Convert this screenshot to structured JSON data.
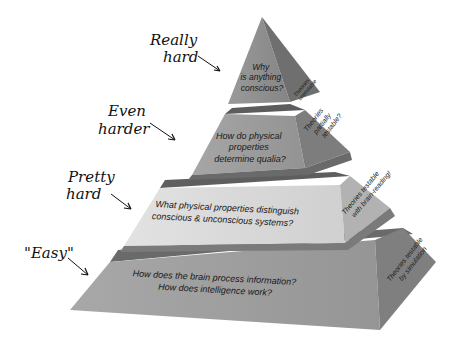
{
  "diagram": {
    "type": "pyramid",
    "tiers": [
      {
        "level": 1,
        "label": "Really hard",
        "label_lines": [
          "Really",
          "hard"
        ],
        "question_lines": [
          "Why",
          "is anything",
          "conscious?"
        ],
        "side_lines": [
          "Theories",
          "untestable"
        ]
      },
      {
        "level": 2,
        "label": "Even harder",
        "label_lines": [
          "Even",
          "harder"
        ],
        "question_lines": [
          "How do physical",
          "properties",
          "determine qualia?"
        ],
        "side_lines": [
          "Theories",
          "partially",
          "testable?"
        ]
      },
      {
        "level": 3,
        "label": "Pretty hard",
        "label_lines": [
          "Pretty",
          "hard"
        ],
        "question_lines": [
          "What physical properties distinguish",
          "conscious & unconscious systems?"
        ],
        "side_lines": [
          "Theories testable",
          "with brain-reading!"
        ]
      },
      {
        "level": 4,
        "label": "\"Easy\"",
        "label_lines": [
          "\"Easy\""
        ],
        "question_lines": [
          "How does the brain process information?",
          "How does intelligence work?"
        ],
        "side_lines": [
          "Theories testable",
          "by simulation"
        ]
      }
    ],
    "colors": {
      "tier1_front": "#8e8e8e",
      "tier1_side": "#6e6e6e",
      "tier2_front": "#9a9a9a",
      "tier2_side": "#7c7c7c",
      "tier3_front": "#d6d6d6",
      "tier3_side": "#b4b4b4",
      "tier4_front": "#9c9c9c",
      "tier4_side": "#808080",
      "top_face": "#555555"
    }
  }
}
